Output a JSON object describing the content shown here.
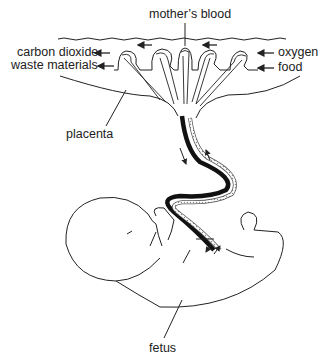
{
  "diagram": {
    "type": "biology-illustration",
    "labels": {
      "mothers_blood": "mother’s blood",
      "carbon_dioxide": "carbon dioxide",
      "waste_materials": "waste materials",
      "oxygen": "oxygen",
      "food": "food",
      "placenta": "placenta",
      "fetus": "fetus"
    },
    "colors": {
      "line": "#222222",
      "background": "#ffffff",
      "cord_dark": "#111111",
      "cord_light": "#bbbbbb"
    }
  }
}
